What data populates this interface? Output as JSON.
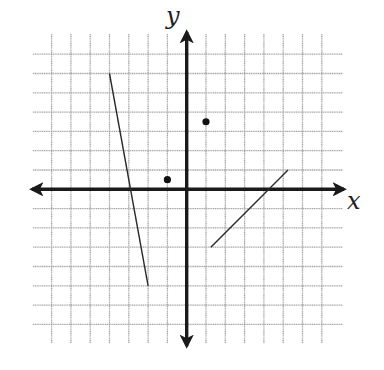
{
  "chart_data": {
    "type": "coordinate-plane",
    "title": "",
    "xlabel": "x",
    "ylabel": "y",
    "grid": true,
    "grid_lines": {
      "x": [
        -7,
        -6,
        -5,
        -4,
        -3,
        -2,
        -1,
        1,
        2,
        3,
        4,
        5,
        6,
        7
      ],
      "y": [
        -7,
        -6,
        -5,
        -4,
        -3,
        -2,
        -1,
        1,
        2,
        3,
        4,
        5,
        6,
        7
      ]
    },
    "xlim": [
      -8,
      8
    ],
    "ylim": [
      -8,
      8
    ],
    "tick_labels": false,
    "segments": [
      {
        "name": "steep-negative-segment",
        "from": [
          -4,
          6
        ],
        "to": [
          -2,
          -5
        ]
      },
      {
        "name": "positive-slope-segment",
        "from": [
          1.25,
          -3
        ],
        "to": [
          5.25,
          1
        ]
      }
    ],
    "points": [
      {
        "name": "point-a",
        "x": -1,
        "y": 0.5
      },
      {
        "name": "point-b",
        "x": 1,
        "y": 3.5
      }
    ]
  },
  "layout": {
    "origin_px": [
      186.7,
      189.3
    ],
    "unit_px": 19.3,
    "grid_extent_px": {
      "left": 33,
      "right": 343,
      "top": 34,
      "bottom": 343
    },
    "axis_extent_px": {
      "left": 32,
      "right": 344,
      "top": 32,
      "bottom": 346
    }
  },
  "labels": {
    "x_axis": "x",
    "y_axis": "y"
  },
  "colors": {
    "grid": "#a6a6a6",
    "axis": "#1a1a1a",
    "segment": "#2a2a2a",
    "point": "#111111"
  }
}
